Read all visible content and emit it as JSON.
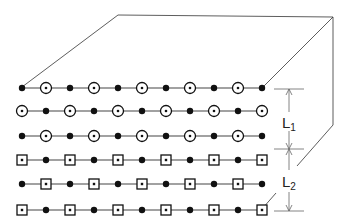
{
  "diagram": {
    "labels": {
      "L1": {
        "main": "L",
        "sub": "1"
      },
      "L2": {
        "main": "L",
        "sub": "2"
      }
    },
    "rows": [
      {
        "pattern": "dot-circle",
        "start": "dot"
      },
      {
        "pattern": "circle-dot",
        "start": "circle"
      },
      {
        "pattern": "dot-circle",
        "start": "dot"
      },
      {
        "pattern": "square-dot",
        "start": "square"
      },
      {
        "pattern": "dot-square",
        "start": "dot"
      },
      {
        "pattern": "square-dot",
        "start": "square"
      }
    ],
    "sites_per_row": 11,
    "symbols": {
      "dot": "filled-circle",
      "circle": "circled-dot",
      "square": "boxed-dot"
    },
    "colors": {
      "line": "#333333",
      "atom": "#111111",
      "background": "#ffffff"
    }
  }
}
